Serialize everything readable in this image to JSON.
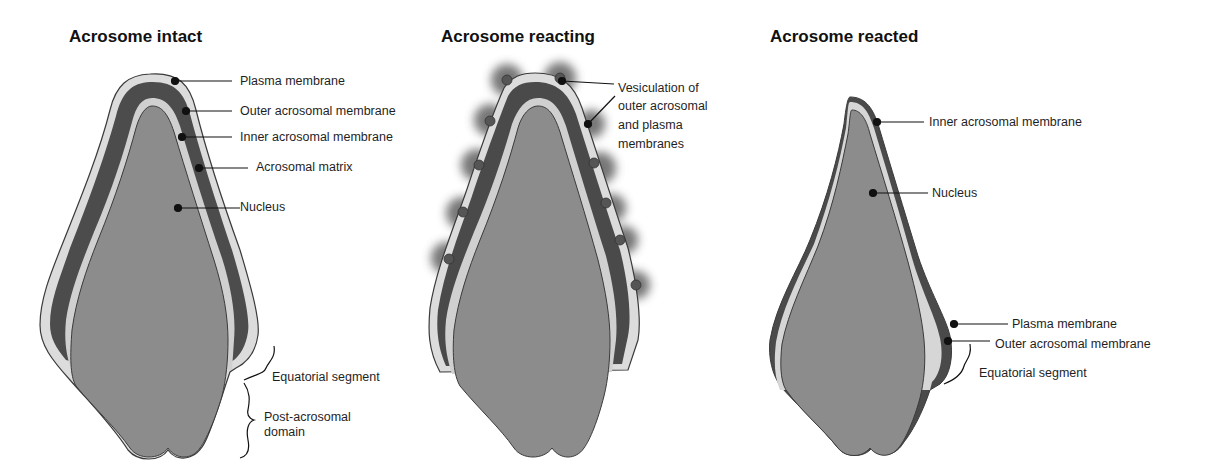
{
  "panels": [
    {
      "title": "Acrosome intact",
      "labels": {
        "plasma_membrane": "Plasma membrane",
        "outer_acrosomal_membrane": "Outer acrosomal membrane",
        "inner_acrosomal_membrane": "Inner acrosomal membrane",
        "acrosomal_matrix": "Acrosomal matrix",
        "nucleus": "Nucleus",
        "equatorial_segment": "Equatorial segment",
        "post_acrosomal_line1": "Post-acrosomal",
        "post_acrosomal_line2": "domain"
      }
    },
    {
      "title": "Acrosome reacting",
      "labels": {
        "vesiculation_line1": "Vesiculation of",
        "vesiculation_line2": "outer acrosomal",
        "vesiculation_line3": "and plasma",
        "vesiculation_line4": "membranes"
      }
    },
    {
      "title": "Acrosome reacted",
      "labels": {
        "inner_acrosomal_membrane": "Inner acrosomal membrane",
        "nucleus": "Nucleus",
        "plasma_membrane": "Plasma membrane",
        "outer_acrosomal_membrane": "Outer acrosomal membrane",
        "equatorial_segment": "Equatorial segment"
      }
    }
  ],
  "colors": {
    "nucleus": "#8c8c8c",
    "inner_membrane_band": "#d4d4d4",
    "acrosomal_matrix": "#4a4a4a",
    "outline": "#3a3a3a",
    "pointer": "#111111"
  }
}
